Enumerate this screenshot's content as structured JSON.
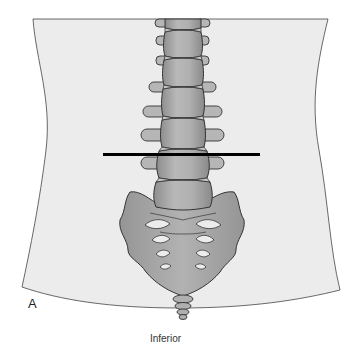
{
  "figure": {
    "panel_label": "A",
    "orientation_label": "Inferior",
    "colors": {
      "background": "#ffffff",
      "torso_fill": "#ececec",
      "bone_fill": "#a8a8a8",
      "bone_light": "#c4c4c4",
      "foramen_fill": "#ececec",
      "outline": "#333333",
      "marker_line": "#000000"
    },
    "marker_line": {
      "x1": 103,
      "x2": 260,
      "y": 154
    }
  }
}
